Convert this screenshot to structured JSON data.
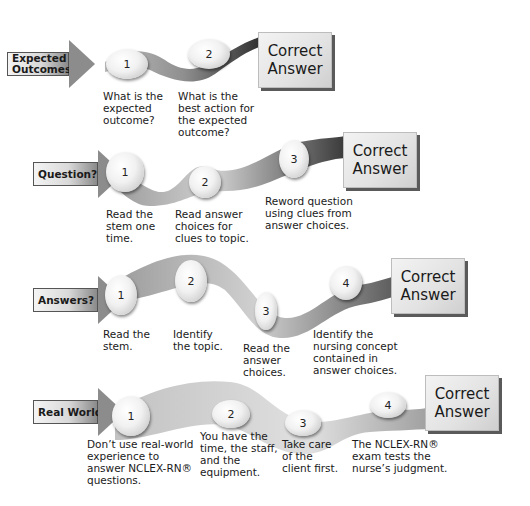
{
  "rows": [
    {
      "label": "Expected\nOutcomes",
      "answer": "Correct\nAnswer",
      "steps": [
        {
          "number": "1",
          "text": "What is the\nexpected\noutcome?"
        },
        {
          "number": "2",
          "text": "What is the\nbest action for\nthe expected\noutcome?"
        }
      ]
    },
    {
      "label": "Question?",
      "answer": "Correct\nAnswer",
      "steps": [
        {
          "number": "1",
          "text": "Read the\nstem one\ntime."
        },
        {
          "number": "2",
          "text": "Read answer\nchoices for\nclues to topic."
        },
        {
          "number": "3",
          "text": "Reword question\nusing clues from\nanswer choices."
        }
      ]
    },
    {
      "label": "Answers?",
      "answer": "Correct\nAnswer",
      "steps": [
        {
          "number": "1",
          "text": "Read the\nstem."
        },
        {
          "number": "2",
          "text": "Identify\nthe topic."
        },
        {
          "number": "3",
          "text": "Read the\nanswer\nchoices."
        },
        {
          "number": "4",
          "text": "Identify the\nnursing concept\ncontained in\nanswer choices."
        }
      ]
    },
    {
      "label": "Real World",
      "answer": "Correct\nAnswer",
      "steps": [
        {
          "number": "1",
          "text": "Don’t use real-world\nexperience to\nanswer NCLEX-RN®\nquestions."
        },
        {
          "number": "2",
          "text": "You have the\ntime, the staff,\nand the\nequipment."
        },
        {
          "number": "3",
          "text": "Take care\nof the\nclient first."
        },
        {
          "number": "4",
          "text": "The NCLEX-RN®\nexam tests the\nnurse’s judgment."
        }
      ]
    }
  ]
}
